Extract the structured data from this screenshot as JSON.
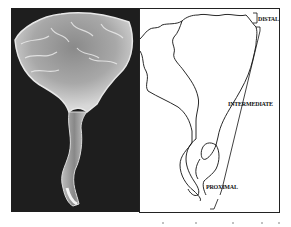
{
  "figure": {
    "panels": [
      {
        "id": "photo",
        "kind": "micrograph",
        "description": "grayscale SEM-style image of a fan-shaped structure with a twisted stalk on dark background"
      },
      {
        "id": "drawing",
        "kind": "line-drawing",
        "description": "outline tracing of the same structure with region brackets"
      }
    ],
    "labels": {
      "distal": "DISTAL",
      "intermediate": "INTERMEDIATE",
      "proximal": "PROXIMAL"
    },
    "colors": {
      "photo_background": "#1e1e1e",
      "line": "#111111",
      "paper": "#ffffff"
    }
  }
}
